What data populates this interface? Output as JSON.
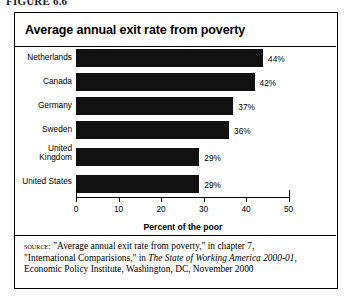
{
  "figure": {
    "caption": "FIGURE 6.6"
  },
  "chart_panel": {
    "title": "Average annual exit rate from poverty"
  },
  "chart_data": {
    "type": "bar",
    "orientation": "horizontal",
    "title": "Average annual exit rate from poverty",
    "categories": [
      "Netherlands",
      "Canada",
      "Germany",
      "Sweden",
      "United\nKingdom",
      "United States"
    ],
    "values": [
      44,
      42,
      37,
      36,
      29,
      29
    ],
    "data_labels": [
      "44%",
      "42%",
      "37%",
      "36%",
      "29%",
      "29%"
    ],
    "xlabel": "Percent of the poor",
    "ylabel": "",
    "xlim": [
      0,
      50
    ],
    "xticks": [
      0,
      10,
      20,
      30,
      40,
      50
    ],
    "xtick_labels": [
      "0",
      "10",
      "20",
      "30",
      "40",
      "50"
    ],
    "grid": false,
    "legend": false,
    "bar_color": "#111111"
  },
  "source": {
    "label": "source:",
    "line1": " \"Average annual exit rate from poverty,\" in chapter 7,",
    "line2_pre": "\"International Comparisions,\" in ",
    "line2_italic": "The State of Working America 2000-01",
    "line2_post": ",",
    "line3": "Economic Policy Institute, Washington, DC, November 2000"
  }
}
